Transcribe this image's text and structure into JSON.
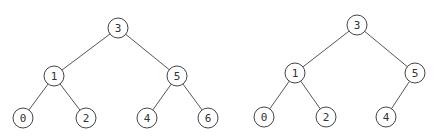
{
  "trees": [
    {
      "name": "left-tree",
      "nodes": [
        {
          "id": "3",
          "label": "3",
          "x": 118,
          "y": 28
        },
        {
          "id": "1",
          "label": "1",
          "x": 54,
          "y": 76
        },
        {
          "id": "5",
          "label": "5",
          "x": 177,
          "y": 76
        },
        {
          "id": "0",
          "label": "0",
          "x": 23,
          "y": 118
        },
        {
          "id": "2",
          "label": "2",
          "x": 86,
          "y": 118
        },
        {
          "id": "4",
          "label": "4",
          "x": 147,
          "y": 118
        },
        {
          "id": "6",
          "label": "6",
          "x": 208,
          "y": 118
        }
      ],
      "edges": [
        [
          "3",
          "1"
        ],
        [
          "3",
          "5"
        ],
        [
          "1",
          "0"
        ],
        [
          "1",
          "2"
        ],
        [
          "5",
          "4"
        ],
        [
          "5",
          "6"
        ]
      ]
    },
    {
      "name": "right-tree",
      "nodes": [
        {
          "id": "3",
          "label": "3",
          "x": 357,
          "y": 25
        },
        {
          "id": "1",
          "label": "1",
          "x": 295,
          "y": 73
        },
        {
          "id": "5",
          "label": "5",
          "x": 415,
          "y": 73
        },
        {
          "id": "0",
          "label": "0",
          "x": 264,
          "y": 117
        },
        {
          "id": "2",
          "label": "2",
          "x": 326,
          "y": 117
        },
        {
          "id": "4",
          "label": "4",
          "x": 386,
          "y": 117
        }
      ],
      "edges": [
        [
          "3",
          "1"
        ],
        [
          "3",
          "5"
        ],
        [
          "1",
          "0"
        ],
        [
          "1",
          "2"
        ],
        [
          "5",
          "4"
        ]
      ]
    }
  ],
  "style": {
    "node_radius": 10,
    "stroke": "#444444",
    "background": "#ffffff"
  }
}
